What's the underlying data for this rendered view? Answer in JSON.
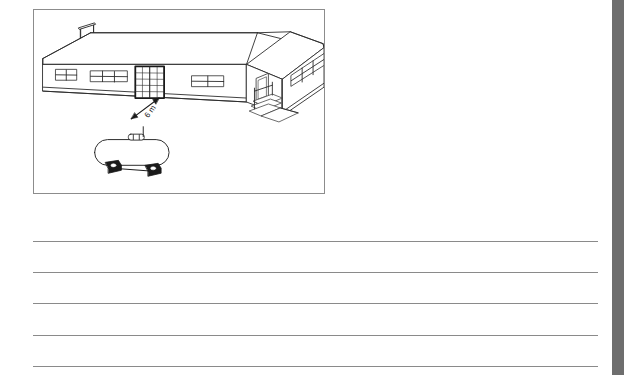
{
  "page": {
    "background_color": "#ffffff",
    "width": 627,
    "height": 375
  },
  "figure": {
    "caption": "",
    "border_color": "#8c8c8c",
    "line_color": "#2b2b2b",
    "fill_color": "#ffffff",
    "dimension": {
      "label": "6 m",
      "from": "propane-tank",
      "to": "sliding-glass-door"
    },
    "elements": {
      "building_label": "single-storey building",
      "chimney_label": "chimney",
      "roof_label": "hip roof",
      "sliding_door_label": "sliding glass door",
      "side_door_label": "side entry door",
      "steps_label": "entry steps",
      "tank_label": "horizontal propane tank",
      "tank_valve_label": "tank valve assembly",
      "tank_saddle_label": "tank saddle support"
    },
    "window_count": 5,
    "saddle_count": 2
  },
  "answer_area": {
    "line_count": 5,
    "line_color": "#8a8a8a",
    "placeholder": ""
  },
  "right_bar": {
    "color": "#6e6e6e",
    "name": "scrollbar"
  }
}
